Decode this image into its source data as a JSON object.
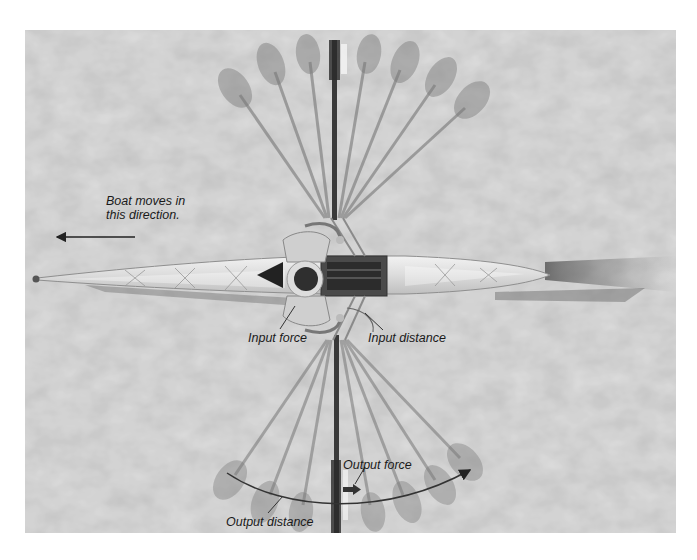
{
  "figure": {
    "background_color": "#bdbdbd",
    "labels": {
      "boat_direction_line1": "Boat moves in",
      "boat_direction_line2": "this direction.",
      "input_force": "Input force",
      "input_distance": "Input distance",
      "output_force": "Output force",
      "output_distance": "Output distance"
    },
    "annotations": [
      {
        "id": "boat-direction-arrow",
        "direction": "left"
      },
      {
        "id": "output-force-arrow",
        "direction": "right"
      },
      {
        "id": "output-distance-arc",
        "direction": "right"
      }
    ]
  }
}
